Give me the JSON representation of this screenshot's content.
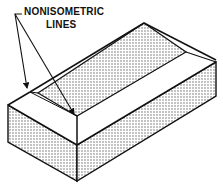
{
  "figure": {
    "type": "isometric technical drawing",
    "callout": {
      "line1": "NONISOMETRIC",
      "line2": "LINES",
      "arrow_count": 2
    },
    "colors": {
      "line": "#111111",
      "stipple": "#555555",
      "background": "#ffffff"
    }
  }
}
